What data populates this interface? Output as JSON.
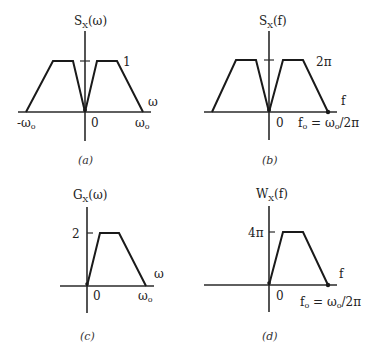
{
  "panels": [
    {
      "id": "a",
      "caption": "(a)",
      "title_main": "S",
      "title_sub": "X",
      "title_arg": "(ω)",
      "x_var": "ω",
      "level_label": "1",
      "zero_label": "0",
      "left_label": "-ω",
      "left_label_sub": "o",
      "right_label": "ω",
      "right_label_sub": "o"
    },
    {
      "id": "b",
      "caption": "(b)",
      "title_main": "S",
      "title_sub": "X",
      "title_arg": "(f)",
      "x_var": "f",
      "level_label": "2π",
      "zero_label": "0",
      "right_label": "f",
      "right_label_sub": "o",
      "right_label_rest": " = ω",
      "right_label_sub2": "o",
      "right_label_tail": "/2π"
    },
    {
      "id": "c",
      "caption": "(c)",
      "title_main": "G",
      "title_sub": "X",
      "title_arg": "(ω)",
      "x_var": "ω",
      "level_label": "2",
      "zero_label": "0",
      "right_label": "ω",
      "right_label_sub": "o"
    },
    {
      "id": "d",
      "caption": "(d)",
      "title_main": "W",
      "title_sub": "X",
      "title_arg": "(f)",
      "x_var": "f",
      "level_label": "4π",
      "zero_label": "0",
      "right_label": "f",
      "right_label_sub": "o",
      "right_label_rest": " = ω",
      "right_label_sub2": "o",
      "right_label_tail": "/2π"
    }
  ],
  "colors": {
    "line": "#1a1a1a",
    "text": "#222222",
    "background": "#ffffff"
  }
}
